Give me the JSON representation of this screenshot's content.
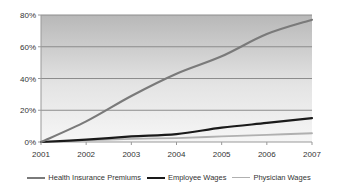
{
  "chart_data": {
    "type": "line",
    "title": "",
    "xlabel": "",
    "ylabel": "",
    "x": [
      "2001",
      "2002",
      "2003",
      "2004",
      "2005",
      "2006",
      "2007"
    ],
    "ylim": [
      0,
      80
    ],
    "yticks": [
      "0%",
      "20%",
      "40%",
      "60%",
      "80%"
    ],
    "grid": true,
    "legend_position": "bottom",
    "series": [
      {
        "name": "Health Insurance Premiums",
        "color": "#7a7a7a",
        "width": 2.2,
        "values": [
          0,
          13,
          29,
          43,
          54,
          68,
          77
        ]
      },
      {
        "name": "Employee Wages",
        "color": "#1a1a1a",
        "width": 2.2,
        "values": [
          0,
          1.5,
          3.5,
          5,
          9,
          12,
          15
        ]
      },
      {
        "name": "Physician Wages",
        "color": "#b0b0b0",
        "width": 1.8,
        "values": [
          0,
          1,
          2,
          2.5,
          3.5,
          4.5,
          5.5
        ]
      }
    ]
  },
  "legend": {
    "items": [
      {
        "label": "Health Insurance Premiums",
        "color": "#7a7a7a"
      },
      {
        "label": "Employee Wages",
        "color": "#1a1a1a"
      },
      {
        "label": "Physician Wages",
        "color": "#b0b0b0"
      }
    ]
  }
}
